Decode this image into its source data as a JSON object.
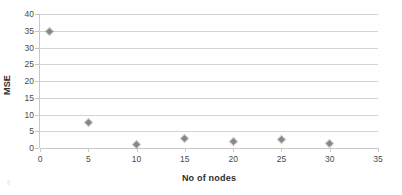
{
  "chart_data": {
    "type": "scatter",
    "title": "",
    "xlabel": "No of nodes",
    "ylabel": "MSE",
    "xlim": [
      0,
      35
    ],
    "ylim": [
      0,
      40
    ],
    "x_ticks": [
      0,
      5,
      10,
      15,
      20,
      25,
      30,
      35
    ],
    "y_ticks": [
      0,
      5,
      10,
      15,
      20,
      25,
      30,
      35,
      40
    ],
    "grid": "horizontal",
    "legend": "none",
    "marker": "diamond",
    "marker_color": "#888888",
    "gridline_color": "#d4d4d4",
    "axis_color": "#c9c9c9",
    "series": [
      {
        "name": "MSE",
        "x": [
          1,
          5,
          10,
          15,
          20,
          25,
          30
        ],
        "y": [
          34.7,
          7.6,
          1.1,
          2.9,
          2.0,
          2.6,
          1.4
        ]
      }
    ]
  },
  "axes": {
    "y_title": "MSE",
    "x_title": "No of nodes",
    "y_tick_labels": [
      "40",
      "35",
      "30",
      "25",
      "20",
      "15",
      "10",
      "5",
      "0"
    ],
    "x_tick_labels": [
      "0",
      "5",
      "10",
      "15",
      "20",
      "25",
      "30",
      "35"
    ]
  }
}
